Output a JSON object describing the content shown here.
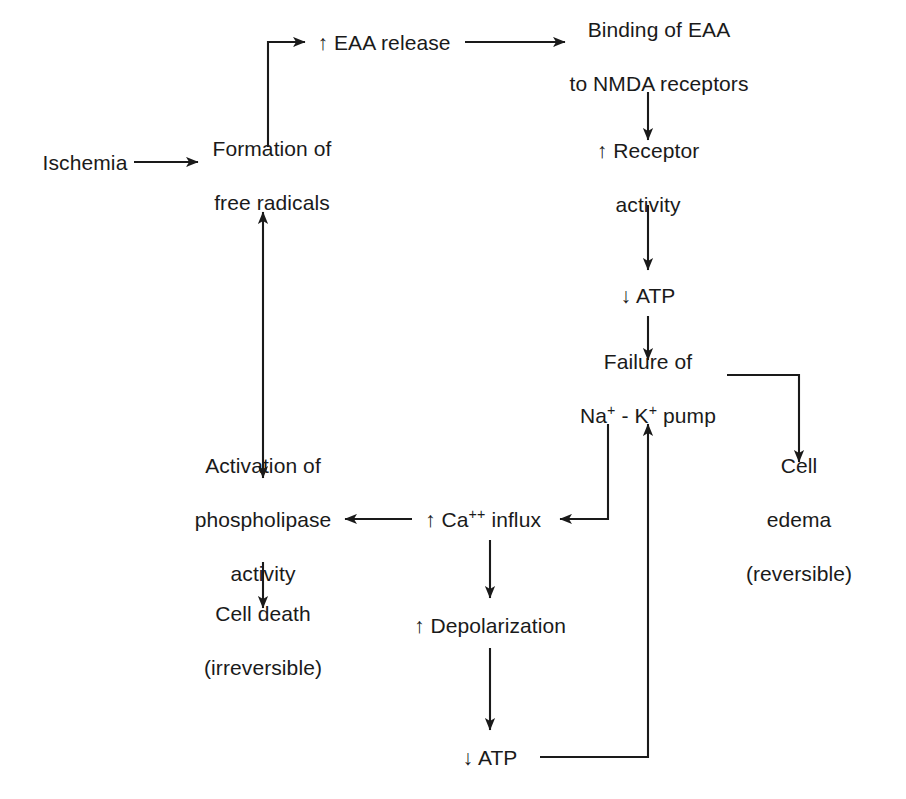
{
  "diagram": {
    "background_color": "#ffffff",
    "ink_color": "#1a1a1a",
    "nodes": [
      {
        "id": "ischemia",
        "label": "Ischemia",
        "x": 85,
        "y": 162
      },
      {
        "id": "free_radicals",
        "label": "Formation of\nfree radicals",
        "x": 272,
        "y": 175
      },
      {
        "id": "eaa_release",
        "label": "↑ EAA release",
        "x": 384,
        "y": 42
      },
      {
        "id": "eaa_binding",
        "label": "Binding of EAA\nto NMDA receptors",
        "x": 659,
        "y": 56
      },
      {
        "id": "receptor_act",
        "label": "↑ Receptor\nactivity",
        "x": 648,
        "y": 177
      },
      {
        "id": "atp_down_top",
        "label": "↓ ATP",
        "x": 648,
        "y": 295
      },
      {
        "id": "pump_failure",
        "label": "Failure of\nNa+ - K+ pump",
        "x": 648,
        "y": 388
      },
      {
        "id": "cell_edema",
        "label": "Cell\nedema\n(reversible)",
        "x": 799,
        "y": 519
      },
      {
        "id": "ca_influx",
        "label": "↑ Ca++ influx",
        "x": 483,
        "y": 519
      },
      {
        "id": "phospholipase",
        "label": "Activation of\nphospholipase\nactivity",
        "x": 263,
        "y": 519
      },
      {
        "id": "cell_death",
        "label": "Cell death\n(irreversible)",
        "x": 263,
        "y": 640
      },
      {
        "id": "depolarization",
        "label": "↑ Depolarization",
        "x": 490,
        "y": 625
      },
      {
        "id": "atp_down_bot",
        "label": "↓ ATP",
        "x": 490,
        "y": 757
      }
    ],
    "node_labels": {
      "ischemia": "Ischemia",
      "free_radicals_line1": "Formation of",
      "free_radicals_line2": "free radicals",
      "eaa_release": "↑ EAA release",
      "eaa_binding_line1": "Binding of EAA",
      "eaa_binding_line2": "to NMDA receptors",
      "receptor_act_line1": "↑ Receptor",
      "receptor_act_line2": "activity",
      "atp_down_top": "↓ ATP",
      "pump_failure_line1": "Failure of",
      "pump_failure_line2_na": "Na",
      "pump_failure_line2_sup1": "+",
      "pump_failure_line2_sep": " - K",
      "pump_failure_line2_sup2": "+",
      "pump_failure_line2_tail": " pump",
      "cell_edema_line1": "Cell",
      "cell_edema_line2": "edema",
      "cell_edema_line3": "(reversible)",
      "ca_influx_lead": "↑ Ca",
      "ca_influx_sup": "++",
      "ca_influx_tail": " influx",
      "phospholipase_line1": "Activation of",
      "phospholipase_line2": "phospholipase",
      "phospholipase_line3": "activity",
      "cell_death_line1": "Cell death",
      "cell_death_line2": "(irreversible)",
      "depolarization": "↑ Depolarization",
      "atp_down_bot": "↓ ATP"
    },
    "edges": [
      {
        "id": "ischemia-to-free-radicals",
        "from": "ischemia",
        "to": "free_radicals",
        "kind": "straight-right"
      },
      {
        "id": "free-radicals-to-eaa",
        "from": "free_radicals",
        "to": "eaa_release",
        "kind": "elbow-up-right"
      },
      {
        "id": "eaa-to-binding",
        "from": "eaa_release",
        "to": "eaa_binding",
        "kind": "straight-right"
      },
      {
        "id": "binding-to-receptor",
        "from": "eaa_binding",
        "to": "receptor_act",
        "kind": "straight-down"
      },
      {
        "id": "receptor-to-atp",
        "from": "receptor_act",
        "to": "atp_down_top",
        "kind": "straight-down"
      },
      {
        "id": "atp-to-pump-failure",
        "from": "atp_down_top",
        "to": "pump_failure",
        "kind": "straight-down"
      },
      {
        "id": "pump-failure-to-cell-edema",
        "from": "pump_failure",
        "to": "cell_edema",
        "kind": "elbow-right-down"
      },
      {
        "id": "pump-failure-to-ca-influx",
        "from": "pump_failure",
        "to": "ca_influx",
        "kind": "elbow-down-left"
      },
      {
        "id": "ca-influx-to-phospholipase",
        "from": "ca_influx",
        "to": "phospholipase",
        "kind": "straight-left"
      },
      {
        "id": "ca-influx-to-depolarization",
        "from": "ca_influx",
        "to": "depolarization",
        "kind": "straight-down"
      },
      {
        "id": "depolarization-to-atp",
        "from": "depolarization",
        "to": "atp_down_bot",
        "kind": "straight-down"
      },
      {
        "id": "atp-bot-to-pump-failure",
        "from": "atp_down_bot",
        "to": "pump_failure",
        "kind": "elbow-right-up"
      },
      {
        "id": "phospholipase-free-radicals",
        "from": "phospholipase",
        "to": "free_radicals",
        "kind": "double-headed-vertical"
      },
      {
        "id": "phospholipase-to-cell-death",
        "from": "phospholipase",
        "to": "cell_death",
        "kind": "straight-down"
      }
    ]
  }
}
